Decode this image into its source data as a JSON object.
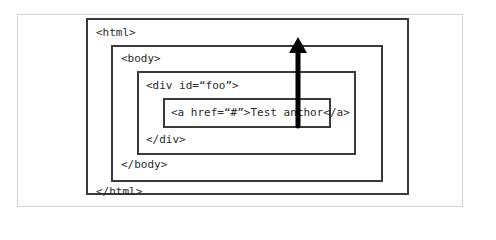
{
  "diagram": {
    "type": "nested-boxes",
    "elements": {
      "html": {
        "open": "<html>",
        "close": "</html>"
      },
      "body": {
        "open": "<body>",
        "close": "</body>"
      },
      "div": {
        "open": "<div id=“foo”>",
        "close": "</div>"
      },
      "anchor": {
        "text": "<a href=“#”>Test anchor</a>"
      }
    },
    "arrow": {
      "direction": "up",
      "from": "anchor",
      "to": "html",
      "meaning": "event bubbling"
    },
    "colors": {
      "box_border": "#3a3a3a",
      "frame_border": "#d4d4d4",
      "text": "#2a2a2a",
      "arrow": "#000000"
    }
  }
}
